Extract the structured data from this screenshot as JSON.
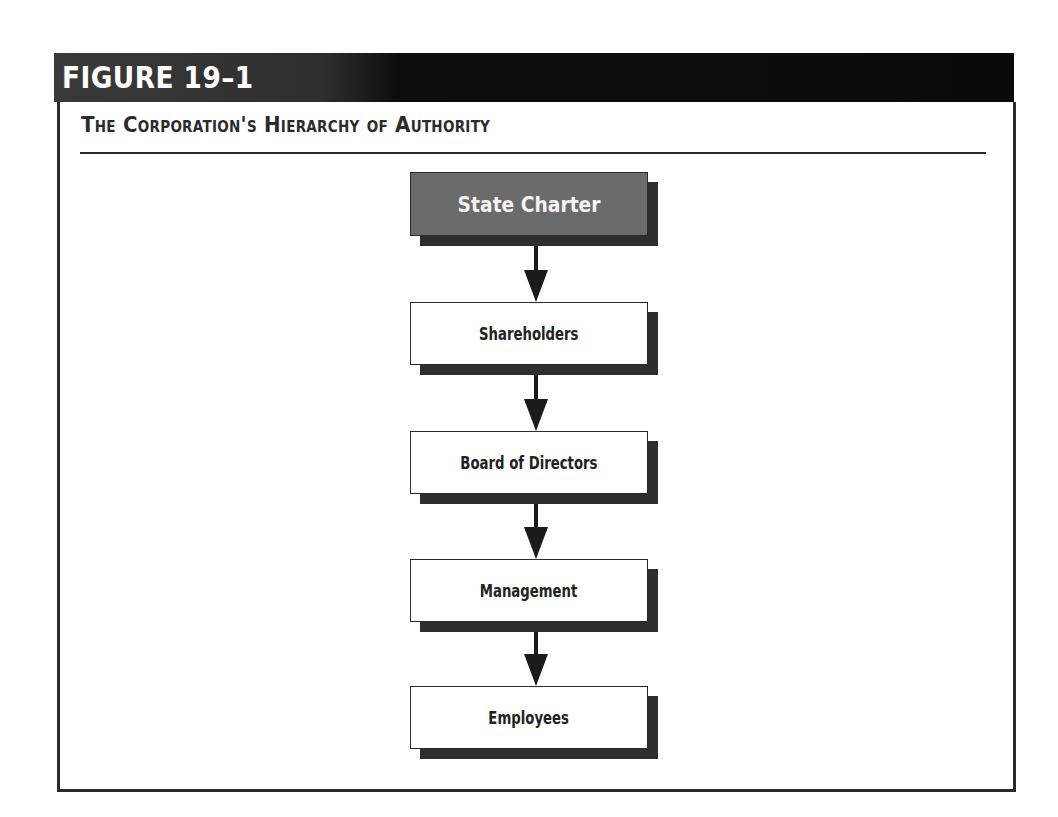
{
  "figure": {
    "label": "FIGURE 19–1",
    "title": "The Corporation's Hierarchy of Authority"
  },
  "diagram": {
    "type": "vertical-flowchart",
    "nodes": [
      {
        "id": "state-charter",
        "label": "State Charter",
        "style": "highlighted"
      },
      {
        "id": "shareholders",
        "label": "Shareholders",
        "style": "plain"
      },
      {
        "id": "board-of-directors",
        "label": "Board of Directors",
        "style": "plain"
      },
      {
        "id": "management",
        "label": "Management",
        "style": "plain"
      },
      {
        "id": "employees",
        "label": "Employees",
        "style": "plain"
      }
    ],
    "edges": [
      {
        "from": "state-charter",
        "to": "shareholders"
      },
      {
        "from": "shareholders",
        "to": "board-of-directors"
      },
      {
        "from": "board-of-directors",
        "to": "management"
      },
      {
        "from": "management",
        "to": "employees"
      }
    ]
  },
  "colors": {
    "header_bg": "#0a0a0a",
    "root_node_bg": "#6b6b6b",
    "node_bg": "#ffffff",
    "shadow": "#2e2e2e",
    "line": "#2a2a2a"
  }
}
